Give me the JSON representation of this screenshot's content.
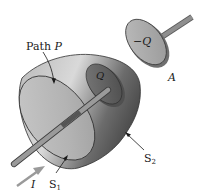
{
  "figure": {
    "labels": {
      "path": "Path ",
      "path_var": "P",
      "charge_inner": "Q",
      "charge_outer": "−Q",
      "plate_outer": "A",
      "surface_1": "S",
      "surface_1_sub": "1",
      "surface_2": "S",
      "surface_2_sub": "2",
      "current": "I"
    },
    "colors": {
      "background": "#ffffff",
      "body_light": "#c4c4c4",
      "body_dark": "#6e6e6e",
      "disk_face": "#b8b8b8",
      "rod": "#8a8a8a",
      "rod_dark": "#5a5a5a",
      "plate": "#a9a9a9",
      "arrow": "#9a9a9a",
      "ink": "#1a1a1a"
    }
  }
}
